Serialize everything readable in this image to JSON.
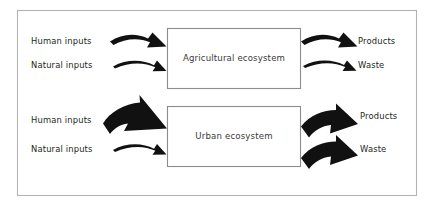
{
  "figure": {
    "frame_color": "#b3b3b3",
    "box_border_color": "#8c8c8c",
    "arrow_color": "#111111",
    "background": "#ffffff",
    "text_color": "#231f20"
  },
  "systems": [
    {
      "id": "agricultural",
      "box_label": "Agricultural ecosystem",
      "inputs": [
        {
          "label": "Human inputs",
          "weight": "medium"
        },
        {
          "label": "Natural inputs",
          "weight": "thin"
        }
      ],
      "outputs": [
        {
          "label": "Products",
          "weight": "medium"
        },
        {
          "label": "Waste",
          "weight": "thin"
        }
      ]
    },
    {
      "id": "urban",
      "box_label": "Urban ecosystem",
      "inputs": [
        {
          "label": "Human inputs",
          "weight": "thick"
        },
        {
          "label": "Natural inputs",
          "weight": "thin"
        }
      ],
      "outputs": [
        {
          "label": "Products",
          "weight": "thick"
        },
        {
          "label": "Waste",
          "weight": "thick"
        }
      ]
    }
  ]
}
